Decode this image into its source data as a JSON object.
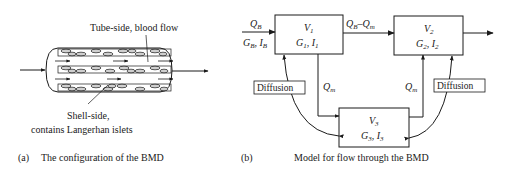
{
  "panel_a": {
    "tube_label": "Tube-side, blood flow",
    "shell_label_line1": "Shell-side,",
    "shell_label_line2": "contains Langerhan islets",
    "caption_marker": "(a)",
    "caption": "The configuration of the BMD"
  },
  "panel_b": {
    "caption_marker": "(b)",
    "caption": "Model for flow through the BMD",
    "inflow": {
      "q": "Q",
      "q_sub": "B",
      "g": "G",
      "g_sub": "B",
      "i": "I",
      "i_sub": "B"
    },
    "flow_v1_v2": {
      "a": "Q",
      "a_sub": "B",
      "minus": "–",
      "b": "Q",
      "b_sub": "m"
    },
    "flow_v1_v3": {
      "q": "Q",
      "q_sub": "m"
    },
    "flow_v3_v2": {
      "q": "Q",
      "q_sub": "m"
    },
    "diffusion_left": "Diffusion",
    "diffusion_right": "Diffusion",
    "boxes": [
      {
        "v": "V",
        "v_sub": "1",
        "g": "G",
        "g_sub": "1",
        "i": "I",
        "i_sub": "1"
      },
      {
        "v": "V",
        "v_sub": "2",
        "g": "G",
        "g_sub": "2",
        "i": "I",
        "i_sub": "2"
      },
      {
        "v": "V",
        "v_sub": "3",
        "g": "G",
        "g_sub": "3",
        "i": "I",
        "i_sub": "3"
      }
    ]
  }
}
